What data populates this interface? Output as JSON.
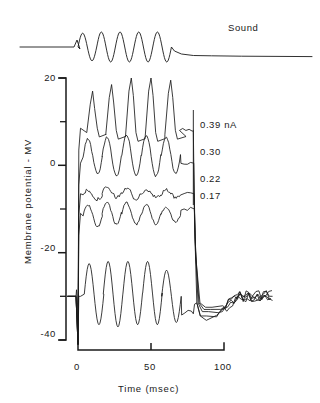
{
  "figure": {
    "sound_label": "Sound",
    "y_axis_title": "Membrane potential - MV",
    "x_axis_title": "Time (msec)"
  },
  "chart_data": {
    "type": "line",
    "title": "",
    "xlabel": "Time (msec)",
    "ylabel": "Membrane potential - MV",
    "xlim": [
      -8,
      135
    ],
    "ylim": [
      -42,
      22
    ],
    "grid": false,
    "legend_position": "right-inline",
    "x_ticks": [
      0,
      50,
      100
    ],
    "x_tick_labels": [
      "0",
      "50",
      "100"
    ],
    "y_ticks": [
      20,
      10,
      0,
      -10,
      -20,
      -30,
      -40
    ],
    "y_tick_labels": [
      "20",
      "",
      "0",
      "",
      "-20",
      "",
      "-40"
    ],
    "y_major_ticks": [
      20,
      0,
      -20,
      -40
    ],
    "y_minor_ticks": [
      10,
      -10,
      -30
    ],
    "annotations": [
      {
        "text": "Sound",
        "x": 108,
        "y": 0,
        "panel": "sound"
      }
    ],
    "stimulus": {
      "onset_msec": 0,
      "offset_msec": 79,
      "cycles": 5,
      "cycle_period_msec": 13.5,
      "resting_potential": -30
    },
    "sound_trace": {
      "name": "Sound",
      "baseline": 0,
      "amplitude": 1.0,
      "onset_msec": 0,
      "offset_msec": 64,
      "cycles": 5,
      "tail_end_msec": 135
    },
    "series": [
      {
        "name": "0.39 nA",
        "label": "0.39 nA",
        "current_nA": 0.39,
        "plateau_mV": 8.5,
        "peak_mV": [
          17.0,
          18.5,
          20.0,
          20.0,
          19.5
        ],
        "trough_mV": [
          6.5,
          6.0,
          5.5,
          5.5,
          6.0
        ],
        "peak_times_msec": [
          10,
          23,
          36.5,
          50,
          63.5
        ],
        "offset_mV": 8.0,
        "final_mV": -30
      },
      {
        "name": "0.30",
        "label": "0.30",
        "current_nA": 0.3,
        "plateau_mV": 0.5,
        "peak_mV": [
          6.0,
          6.5,
          7.0,
          7.0,
          6.5
        ],
        "trough_mV": [
          -2.0,
          -2.5,
          -2.5,
          -2.5,
          -2.0
        ],
        "peak_times_msec": [
          10,
          23,
          36.5,
          50,
          63.5
        ],
        "offset_mV": 0.5,
        "final_mV": -30
      },
      {
        "name": "0.22",
        "label": "0.22",
        "current_nA": 0.22,
        "plateau_mV": -6.5,
        "peak_mV": [
          -5.5,
          -5.0,
          -5.0,
          -5.5,
          -5.5
        ],
        "trough_mV": [
          -8.0,
          -7.5,
          -8.0,
          -7.5,
          -7.5
        ],
        "peak_times_msec": [
          10,
          23,
          36.5,
          50,
          63.5
        ],
        "offset_mV": -6.5,
        "final_mV": -30
      },
      {
        "name": "0.17",
        "label": "0.17",
        "current_nA": 0.17,
        "plateau_mV": -11.0,
        "peak_mV": [
          -9.0,
          -8.5,
          -8.5,
          -9.0,
          -9.5
        ],
        "trough_mV": [
          -14.0,
          -13.5,
          -13.5,
          -13.5,
          -13.0
        ],
        "peak_times_msec": [
          10,
          23,
          36.5,
          50,
          63.5
        ],
        "offset_mV": -10.0,
        "final_mV": -30
      },
      {
        "name": "control",
        "label": "",
        "current_nA": 0,
        "plateau_mV": -30,
        "peak_mV": [
          -22.5,
          -22.0,
          -22.0,
          -22.0,
          -24.0
        ],
        "trough_mV": [
          -36.5,
          -37.0,
          -36.5,
          -36.5,
          -36.0
        ],
        "peak_times_msec": [
          11,
          24,
          37.5,
          51,
          64
        ],
        "offset_mV": -34,
        "final_mV": -30
      }
    ]
  }
}
